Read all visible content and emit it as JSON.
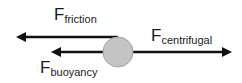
{
  "diagram": {
    "object": {
      "shape": "circle",
      "fill": "#c4c4c4",
      "stroke": "#9a9a9a"
    },
    "forces": [
      {
        "id": "friction",
        "symbol": "F",
        "subscript": "friction",
        "direction": "left"
      },
      {
        "id": "buoyancy",
        "symbol": "F",
        "subscript": "buoyancy",
        "direction": "left"
      },
      {
        "id": "centrifugal",
        "symbol": "F",
        "subscript": "centrifugal",
        "direction": "right"
      }
    ],
    "arrow_color": "#111111"
  }
}
